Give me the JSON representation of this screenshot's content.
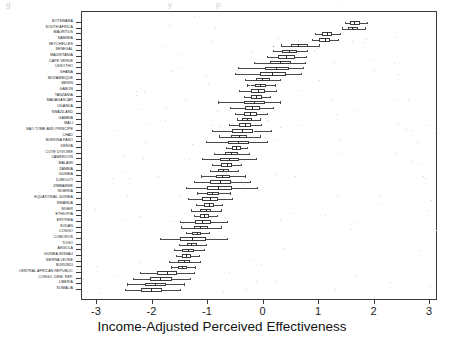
{
  "figure": {
    "type": "boxplot-chart",
    "xlabel": "Income-Adjusted Perceived Effectiveness",
    "ytick_labels": [
      "BOTSWANA",
      "SOUTH AFRICA",
      "MAURITUS",
      "NAMIBIA",
      "SEYCHELLES",
      "SENEGAL",
      "MAURITANIA",
      "CAPE VERDE",
      "LESOTHO",
      "GHANA",
      "MOZAMBIQUE",
      "BENIN",
      "GABON",
      "TANZANIA",
      "MADAGASCAR",
      "UGANDA",
      "SWAZILAND",
      "GAMBIA",
      "MALI",
      "SAO TOME AND PRINCIPE",
      "CHAD",
      "BURKINA FASO",
      "KENYA",
      "COTE D'IVOIRE",
      "CAMEROON",
      "MALAWI",
      "ZAMBIA",
      "GUINEA",
      "DJIBOUTI",
      "ZIMBABWE",
      "NIGERIA",
      "EQUATORIAL GUINEA",
      "RWANDA",
      "NIGER",
      "ETHIOPIA",
      "ERITREA",
      "SUDAN",
      "CONGO",
      "COMOROS",
      "TOGO",
      "ANGOLA",
      "GUINEA-BISSAU",
      "SIERRA LEONE",
      "BURUNDI",
      "CENTRAL AFRICAN REPUBLIC",
      "CONGO, DEM. REP.",
      "LIBERIA",
      "SOMALIA"
    ],
    "xtick_labels": [
      "-3",
      "-2",
      "-1",
      "0",
      "1",
      "2",
      "3"
    ]
  },
  "chart_data": {
    "type": "boxplot",
    "title": "",
    "xlabel": "Income-Adjusted Perceived Effectiveness",
    "ylabel": "",
    "xlim": [
      -3.35,
      3.15
    ],
    "xticks": [
      -3,
      -2,
      -1,
      0,
      1,
      2,
      3
    ],
    "grid": false,
    "legend": "none",
    "orientation": "horizontal",
    "categories": [
      "BOTSWANA",
      "SOUTH AFRICA",
      "MAURITUS",
      "NAMIBIA",
      "SEYCHELLES",
      "SENEGAL",
      "MAURITANIA",
      "CAPE VERDE",
      "LESOTHO",
      "GHANA",
      "MOZAMBIQUE",
      "BENIN",
      "GABON",
      "TANZANIA",
      "MADAGASCAR",
      "UGANDA",
      "SWAZILAND",
      "GAMBIA",
      "MALI",
      "SAO TOME AND PRINCIPE",
      "CHAD",
      "BURKINA FASO",
      "KENYA",
      "COTE D'IVOIRE",
      "CAMEROON",
      "MALAWI",
      "ZAMBIA",
      "GUINEA",
      "DJIBOUTI",
      "ZIMBABWE",
      "NIGERIA",
      "EQUATORIAL GUINEA",
      "RWANDA",
      "NIGER",
      "ETHIOPIA",
      "ERITREA",
      "SUDAN",
      "CONGO",
      "COMOROS",
      "TOGO",
      "ANGOLA",
      "GUINEA-BISSAU",
      "SIERRA LEONE",
      "BURUNDI",
      "CENTRAL AFRICAN REPUBLIC",
      "CONGO, DEM. REP.",
      "LIBERIA",
      "SOMALIA"
    ],
    "boxes": [
      {
        "category": "BOTSWANA",
        "whisker_low": 1.46,
        "q1": 1.55,
        "median": 1.63,
        "q3": 1.73,
        "whisker_high": 1.86,
        "outliers": []
      },
      {
        "category": "SOUTH AFRICA",
        "whisker_low": 1.42,
        "q1": 1.52,
        "median": 1.6,
        "q3": 1.7,
        "whisker_high": 1.82,
        "outliers": []
      },
      {
        "category": "MAURITUS",
        "whisker_low": 0.92,
        "q1": 1.05,
        "median": 1.14,
        "q3": 1.24,
        "whisker_high": 1.38,
        "outliers": []
      },
      {
        "category": "NAMIBIA",
        "whisker_low": 0.88,
        "q1": 1.0,
        "median": 1.1,
        "q3": 1.2,
        "whisker_high": 1.34,
        "outliers": []
      },
      {
        "category": "SEYCHELLES",
        "whisker_low": 0.32,
        "q1": 0.5,
        "median": 0.62,
        "q3": 0.8,
        "whisker_high": 1.0,
        "outliers": [
          0.18
        ]
      },
      {
        "category": "SENEGAL",
        "whisker_low": 0.18,
        "q1": 0.34,
        "median": 0.46,
        "q3": 0.6,
        "whisker_high": 0.78,
        "outliers": []
      },
      {
        "category": "MAURITANIA",
        "whisker_low": 0.06,
        "q1": 0.26,
        "median": 0.4,
        "q3": 0.56,
        "whisker_high": 0.76,
        "outliers": []
      },
      {
        "category": "CAPE VERDE",
        "whisker_low": -0.18,
        "q1": 0.12,
        "median": 0.3,
        "q3": 0.5,
        "whisker_high": 0.74,
        "outliers": []
      },
      {
        "category": "LESOTHO",
        "whisker_low": -0.46,
        "q1": 0.02,
        "median": 0.22,
        "q3": 0.46,
        "whisker_high": 0.72,
        "outliers": []
      },
      {
        "category": "GHANA",
        "whisker_low": -0.52,
        "q1": -0.06,
        "median": 0.16,
        "q3": 0.4,
        "whisker_high": 0.68,
        "outliers": []
      },
      {
        "category": "MOZAMBIQUE",
        "whisker_low": -0.34,
        "q1": -0.14,
        "median": -0.02,
        "q3": 0.12,
        "whisker_high": 0.3,
        "outliers": []
      },
      {
        "category": "BENIN",
        "whisker_low": -0.3,
        "q1": -0.16,
        "median": -0.07,
        "q3": 0.04,
        "whisker_high": 0.2,
        "outliers": []
      },
      {
        "category": "GABON",
        "whisker_low": -0.44,
        "q1": -0.22,
        "median": -0.1,
        "q3": 0.02,
        "whisker_high": 0.22,
        "outliers": []
      },
      {
        "category": "TANZANIA",
        "whisker_low": -0.36,
        "q1": -0.22,
        "median": -0.13,
        "q3": -0.03,
        "whisker_high": 0.12,
        "outliers": []
      },
      {
        "category": "MADAGASCAR",
        "whisker_low": -0.82,
        "q1": -0.36,
        "median": -0.18,
        "q3": 0.02,
        "whisker_high": 0.3,
        "outliers": []
      },
      {
        "category": "UGANDA",
        "whisker_low": -0.6,
        "q1": -0.34,
        "median": -0.21,
        "q3": -0.06,
        "whisker_high": 0.18,
        "outliers": []
      },
      {
        "category": "SWAZILAND",
        "whisker_low": -0.52,
        "q1": -0.36,
        "median": -0.25,
        "q3": -0.12,
        "whisker_high": 0.06,
        "outliers": []
      },
      {
        "category": "GAMBIA",
        "whisker_low": -0.48,
        "q1": -0.38,
        "median": -0.3,
        "q3": -0.2,
        "whisker_high": -0.06,
        "outliers": []
      },
      {
        "category": "MALI",
        "whisker_low": -0.62,
        "q1": -0.44,
        "median": -0.33,
        "q3": -0.22,
        "whisker_high": -0.04,
        "outliers": []
      },
      {
        "category": "SAO TOME AND PRINCIPE",
        "whisker_low": -0.92,
        "q1": -0.56,
        "median": -0.38,
        "q3": -0.18,
        "whisker_high": 0.14,
        "outliers": []
      },
      {
        "category": "CHAD",
        "whisker_low": -0.8,
        "q1": -0.58,
        "median": -0.44,
        "q3": -0.3,
        "whisker_high": -0.06,
        "outliers": []
      },
      {
        "category": "BURKINA FASO",
        "whisker_low": -1.04,
        "q1": -0.64,
        "median": -0.46,
        "q3": -0.26,
        "whisker_high": 0.06,
        "outliers": []
      },
      {
        "category": "KENYA",
        "whisker_low": -0.68,
        "q1": -0.56,
        "median": -0.49,
        "q3": -0.41,
        "whisker_high": -0.3,
        "outliers": []
      },
      {
        "category": "COTE D'IVOIRE",
        "whisker_low": -0.9,
        "q1": -0.7,
        "median": -0.58,
        "q3": -0.46,
        "whisker_high": -0.26,
        "outliers": []
      },
      {
        "category": "CAMEROON",
        "whisker_low": -1.1,
        "q1": -0.78,
        "median": -0.62,
        "q3": -0.44,
        "whisker_high": -0.14,
        "outliers": []
      },
      {
        "category": "MALAWI",
        "whisker_low": -0.92,
        "q1": -0.76,
        "median": -0.66,
        "q3": -0.56,
        "whisker_high": -0.4,
        "outliers": []
      },
      {
        "category": "ZAMBIA",
        "whisker_low": -0.96,
        "q1": -0.82,
        "median": -0.73,
        "q3": -0.62,
        "whisker_high": -0.46,
        "outliers": []
      },
      {
        "category": "GUINEA",
        "whisker_low": -1.12,
        "q1": -0.86,
        "median": -0.74,
        "q3": -0.6,
        "whisker_high": -0.34,
        "outliers": []
      },
      {
        "category": "DJIBOUTI",
        "whisker_low": -1.26,
        "q1": -0.96,
        "median": -0.78,
        "q3": -0.58,
        "whisker_high": -0.24,
        "outliers": []
      },
      {
        "category": "ZIMBABWE",
        "whisker_low": -1.4,
        "q1": -1.02,
        "median": -0.82,
        "q3": -0.56,
        "whisker_high": -0.12,
        "outliers": []
      },
      {
        "category": "NIGERIA",
        "whisker_low": -1.2,
        "q1": -1.02,
        "median": -0.92,
        "q3": -0.8,
        "whisker_high": -0.6,
        "outliers": []
      },
      {
        "category": "EQUATORIAL GUINEA",
        "whisker_low": -1.36,
        "q1": -1.1,
        "median": -0.96,
        "q3": -0.82,
        "whisker_high": -0.56,
        "outliers": []
      },
      {
        "category": "RWANDA",
        "whisker_low": -1.22,
        "q1": -1.08,
        "median": -0.99,
        "q3": -0.9,
        "whisker_high": -0.74,
        "outliers": []
      },
      {
        "category": "NIGER",
        "whisker_low": -1.3,
        "q1": -1.14,
        "median": -1.04,
        "q3": -0.94,
        "whisker_high": -0.76,
        "outliers": []
      },
      {
        "category": "ETHIOPIA",
        "whisker_low": -1.26,
        "q1": -1.14,
        "median": -1.07,
        "q3": -0.98,
        "whisker_high": -0.84,
        "outliers": []
      },
      {
        "category": "ERITREA",
        "whisker_low": -1.5,
        "q1": -1.24,
        "median": -1.1,
        "q3": -0.94,
        "whisker_high": -0.66,
        "outliers": []
      },
      {
        "category": "SUDAN",
        "whisker_low": -1.48,
        "q1": -1.26,
        "median": -1.14,
        "q3": -1.0,
        "whisker_high": -0.76,
        "outliers": []
      },
      {
        "category": "CONGO",
        "whisker_low": -1.4,
        "q1": -1.28,
        "median": -1.2,
        "q3": -1.12,
        "whisker_high": -0.98,
        "outliers": []
      },
      {
        "category": "COMOROS",
        "whisker_low": -1.86,
        "q1": -1.5,
        "median": -1.28,
        "q3": -1.04,
        "whisker_high": -0.66,
        "outliers": []
      },
      {
        "category": "TOGO",
        "whisker_low": -1.52,
        "q1": -1.38,
        "median": -1.3,
        "q3": -1.2,
        "whisker_high": -1.04,
        "outliers": []
      },
      {
        "category": "ANGOLA",
        "whisker_low": -1.62,
        "q1": -1.46,
        "median": -1.36,
        "q3": -1.26,
        "whisker_high": -1.08,
        "outliers": []
      },
      {
        "category": "GUINEA-BISSAU",
        "whisker_low": -1.58,
        "q1": -1.46,
        "median": -1.39,
        "q3": -1.3,
        "whisker_high": -1.16,
        "outliers": []
      },
      {
        "category": "SIERRA LEONE",
        "whisker_low": -1.7,
        "q1": -1.54,
        "median": -1.44,
        "q3": -1.32,
        "whisker_high": -1.14,
        "outliers": []
      },
      {
        "category": "BURUNDI",
        "whisker_low": -1.66,
        "q1": -1.54,
        "median": -1.47,
        "q3": -1.38,
        "whisker_high": -1.24,
        "outliers": []
      },
      {
        "category": "CENTRAL AFRICAN REPUBLIC",
        "whisker_low": -2.22,
        "q1": -1.92,
        "median": -1.74,
        "q3": -1.56,
        "whisker_high": -1.26,
        "outliers": []
      },
      {
        "category": "CONGO, DEM. REP.",
        "whisker_low": -2.36,
        "q1": -2.04,
        "median": -1.86,
        "q3": -1.64,
        "whisker_high": -1.32,
        "outliers": []
      },
      {
        "category": "LIBERIA",
        "whisker_low": -2.46,
        "q1": -2.14,
        "median": -1.96,
        "q3": -1.76,
        "whisker_high": -1.44,
        "outliers": []
      },
      {
        "category": "SOMALIA",
        "whisker_low": -2.5,
        "q1": -2.2,
        "median": -2.02,
        "q3": -1.82,
        "whisker_high": -1.5,
        "outliers": []
      }
    ]
  },
  "ghost_text": {
    "a": "g",
    "b": "y",
    "c": "p",
    "d": "."
  }
}
